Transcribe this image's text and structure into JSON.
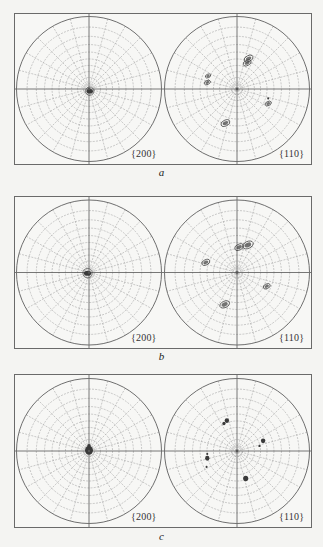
{
  "figure": {
    "type": "pole_figures",
    "colors": {
      "background": "#f4f4f2",
      "frame": "#6a6a6a",
      "circle": "#6f6f6f",
      "grid": "#a8a8a8",
      "axis": "#555555",
      "spot": "#3a3a3a"
    },
    "grid": {
      "rings": 9,
      "radial_step_deg": 15
    },
    "panels": [
      {
        "id": "a",
        "caption": "a",
        "left": {
          "label": "{200}",
          "spots": [
            {
              "x": 0.01,
              "y": 0.03,
              "r": 0.045,
              "kind": "center"
            }
          ]
        },
        "right": {
          "label": "{110}",
          "spots": [
            {
              "x": 0.16,
              "y": -0.42,
              "r": 0.05,
              "kind": "cluster"
            },
            {
              "x": 0.14,
              "y": -0.36,
              "r": 0.045,
              "kind": "cluster"
            },
            {
              "x": -0.4,
              "y": -0.18,
              "r": 0.03,
              "kind": "cluster"
            },
            {
              "x": -0.41,
              "y": -0.09,
              "r": 0.035,
              "kind": "cluster"
            },
            {
              "x": 0.43,
              "y": 0.2,
              "r": 0.035,
              "kind": "cluster"
            },
            {
              "x": 0.43,
              "y": 0.13,
              "r": 0.012,
              "kind": "dot"
            },
            {
              "x": -0.16,
              "y": 0.47,
              "r": 0.05,
              "kind": "cluster"
            }
          ]
        }
      },
      {
        "id": "b",
        "caption": "b",
        "left": {
          "label": "{200}",
          "spots": [
            {
              "x": -0.02,
              "y": 0.01,
              "r": 0.05,
              "kind": "center"
            }
          ]
        },
        "right": {
          "label": "{110}",
          "spots": [
            {
              "x": 0.03,
              "y": -0.35,
              "r": 0.05,
              "kind": "cluster"
            },
            {
              "x": 0.15,
              "y": -0.38,
              "r": 0.06,
              "kind": "cluster"
            },
            {
              "x": -0.43,
              "y": -0.14,
              "r": 0.045,
              "kind": "cluster"
            },
            {
              "x": 0.41,
              "y": 0.19,
              "r": 0.04,
              "kind": "cluster"
            },
            {
              "x": -0.17,
              "y": 0.44,
              "r": 0.055,
              "kind": "cluster"
            }
          ]
        }
      },
      {
        "id": "c",
        "caption": "c",
        "left": {
          "label": "{200}",
          "spots": [
            {
              "x": 0.0,
              "y": -0.01,
              "r": 0.055,
              "kind": "solid"
            },
            {
              "x": 0.0,
              "y": -0.07,
              "r": 0.025,
              "kind": "solid"
            }
          ]
        },
        "right": {
          "label": "{110}",
          "spots": [
            {
              "x": -0.14,
              "y": -0.42,
              "r": 0.03,
              "kind": "solid"
            },
            {
              "x": -0.18,
              "y": -0.38,
              "r": 0.022,
              "kind": "solid"
            },
            {
              "x": 0.36,
              "y": -0.14,
              "r": 0.03,
              "kind": "solid"
            },
            {
              "x": 0.31,
              "y": -0.07,
              "r": 0.015,
              "kind": "dot"
            },
            {
              "x": -0.41,
              "y": 0.1,
              "r": 0.03,
              "kind": "solid"
            },
            {
              "x": -0.41,
              "y": 0.04,
              "r": 0.012,
              "kind": "dot"
            },
            {
              "x": -0.42,
              "y": 0.22,
              "r": 0.01,
              "kind": "dot"
            },
            {
              "x": 0.12,
              "y": 0.38,
              "r": 0.035,
              "kind": "solid"
            }
          ]
        }
      }
    ]
  }
}
